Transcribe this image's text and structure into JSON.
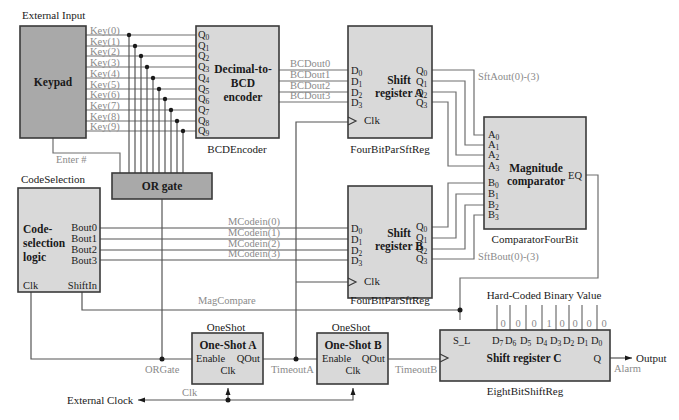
{
  "colors": {
    "box_dark": "#a9a9a9",
    "box_light": "#d9d9d9",
    "border": "#3a3a3a",
    "wire": "#6e6e6e",
    "signal_label": "#8a8a8a",
    "text": "#1a1a1a"
  },
  "keypad": {
    "caption": "External Input",
    "label": "Keypad",
    "outputs": [
      "Key(0)",
      "Key(1)",
      "Key(2)",
      "Key(3)",
      "Key(4)",
      "Key(5)",
      "Key(6)",
      "Key(7)",
      "Key(8)",
      "Key(9)"
    ],
    "enter_signal": "Enter #"
  },
  "encoder": {
    "label_line1": "Decimal-to-",
    "label_line2": "BCD",
    "label_line3": "encoder",
    "caption": "BCDEncoder",
    "input_pin_prefix": "Q",
    "input_pins": [
      "0",
      "1",
      "2",
      "3",
      "4",
      "5",
      "6",
      "7",
      "8",
      "9"
    ],
    "outputs": [
      "BCDout0",
      "BCDout1",
      "BCDout2",
      "BCDout3"
    ]
  },
  "or_gate": {
    "label": "OR gate",
    "output_signal": "ORGate"
  },
  "shift_reg_a": {
    "label_line1": "Shift",
    "label_line2": "register A",
    "caption": "FourBitParSftReg",
    "clk": "Clk",
    "output_signal": "SftAout(0)-(3)"
  },
  "shift_reg_b": {
    "label_line1": "Shift",
    "label_line2": "register B",
    "caption": "FourBitParSftReg",
    "clk": "Clk",
    "output_signal": "SftBout(0)-(3)"
  },
  "comparator": {
    "label_line1": "Magnitude",
    "label_line2": "comparator",
    "caption": "ComparatorFourBit",
    "output_pin": "EQ"
  },
  "code_selection": {
    "caption": "CodeSelection",
    "label_line1": "Code-",
    "label_line2": "selection",
    "label_line3": "logic",
    "outputs": [
      "Bout0",
      "Bout1",
      "Bout2",
      "Bout3"
    ],
    "clk": "Clk",
    "shift_in": "ShiftIn",
    "signals": [
      "MCodein(0)",
      "MCodein(1)",
      "MCodein(2)",
      "MCodein(3)"
    ],
    "mag_compare": "MagCompare"
  },
  "oneshot_a": {
    "caption": "OneShot",
    "label": "One-Shot A",
    "enable": "Enable",
    "qout": "QOut",
    "clk": "Clk",
    "output_signal": "TimeoutA"
  },
  "oneshot_b": {
    "caption": "OneShot",
    "label": "One-Shot B",
    "enable": "Enable",
    "qout": "QOut",
    "clk": "Clk",
    "output_signal": "TimeoutB"
  },
  "shift_reg_c": {
    "label": "Shift register C",
    "caption": "EightBitShiftReg",
    "s_l": "S_L",
    "q": "Q",
    "hardcoded_title": "Hard-Coded Binary Value",
    "bits": [
      "0",
      "0",
      "0",
      "1",
      "0",
      "0",
      "0",
      "0"
    ],
    "d_pins": [
      "7",
      "6",
      "5",
      "4",
      "3",
      "2",
      "1",
      "0"
    ],
    "output_label": "Output",
    "output_signal": "Alarm"
  },
  "clock": {
    "label": "External Clock",
    "signal": "Clk"
  }
}
